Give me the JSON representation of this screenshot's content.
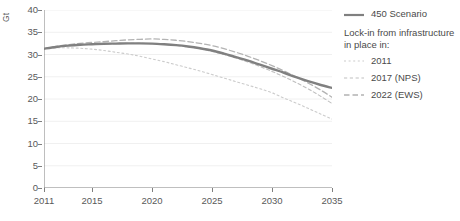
{
  "chart_data": {
    "type": "line",
    "title": "",
    "xlabel": "",
    "ylabel": "Gt",
    "xlim": [
      2011,
      2035
    ],
    "ylim": [
      0,
      40
    ],
    "grid": true,
    "legend_position": "right",
    "x_ticks": [
      "2011",
      "2015",
      "2020",
      "2025",
      "2030",
      "2035"
    ],
    "x_tick_values": [
      2011,
      2015,
      2020,
      2025,
      2030,
      2035
    ],
    "y_ticks": [
      "0",
      "5",
      "10",
      "15",
      "20",
      "25",
      "30",
      "35",
      "40"
    ],
    "y_tick_values": [
      0,
      5,
      10,
      15,
      20,
      25,
      30,
      35,
      40
    ],
    "x": [
      2011,
      2012,
      2013,
      2014,
      2015,
      2016,
      2017,
      2018,
      2019,
      2020,
      2021,
      2022,
      2023,
      2024,
      2025,
      2026,
      2027,
      2028,
      2029,
      2030,
      2031,
      2032,
      2033,
      2034,
      2035
    ],
    "series": [
      {
        "name": "450 Scenario",
        "style": "solid",
        "color": "#808080",
        "values": [
          31.3,
          31.7,
          32.0,
          32.2,
          32.3,
          32.4,
          32.45,
          32.5,
          32.5,
          32.45,
          32.3,
          32.1,
          31.8,
          31.4,
          30.9,
          30.2,
          29.4,
          28.6,
          27.7,
          26.8,
          25.9,
          24.9,
          24.0,
          23.2,
          22.5
        ]
      },
      {
        "name": "2011",
        "style": "dotted",
        "color": "#cccccc",
        "values": [
          31.3,
          31.5,
          31.5,
          31.4,
          31.2,
          30.9,
          30.5,
          30.1,
          29.6,
          29.0,
          28.4,
          27.7,
          27.0,
          26.3,
          25.5,
          24.7,
          23.9,
          23.1,
          22.3,
          21.4,
          20.2,
          19.1,
          17.9,
          16.7,
          15.5
        ]
      },
      {
        "name": "2017 (NPS)",
        "style": "dashed-short",
        "color": "#bfbfbf",
        "values": [
          31.3,
          31.7,
          32.0,
          32.2,
          32.3,
          32.4,
          32.45,
          32.5,
          32.5,
          32.45,
          32.3,
          32.05,
          31.7,
          31.3,
          30.7,
          30.0,
          29.2,
          28.3,
          27.3,
          26.2,
          25.0,
          23.7,
          22.3,
          20.7,
          19.0
        ]
      },
      {
        "name": "2022 (EWS)",
        "style": "dashed-long",
        "color": "#b3b3b3",
        "values": [
          31.3,
          31.8,
          32.2,
          32.5,
          32.7,
          32.9,
          33.1,
          33.3,
          33.4,
          33.5,
          33.4,
          33.2,
          32.9,
          32.5,
          32.0,
          31.3,
          30.5,
          29.6,
          28.6,
          27.5,
          26.3,
          25.0,
          23.6,
          22.1,
          20.4
        ]
      }
    ]
  },
  "axis": {
    "y_title": "Gt"
  },
  "legend": {
    "primary": {
      "label": "450 Scenario"
    },
    "heading": "Lock-in from infrastructure in place in:",
    "items": [
      {
        "label": "2011"
      },
      {
        "label": "2017 (NPS)"
      },
      {
        "label": "2022 (EWS)"
      }
    ]
  }
}
